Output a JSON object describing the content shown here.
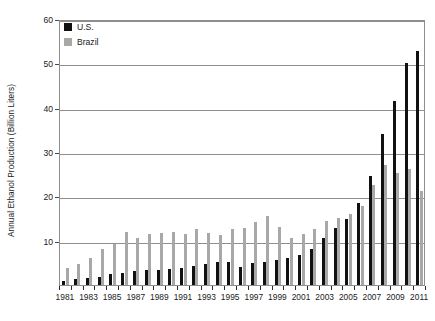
{
  "chart_data": {
    "type": "bar",
    "title": "",
    "xlabel": "",
    "ylabel": "Annual Ethanol Production (Billion Liters)",
    "ylim": [
      0,
      60
    ],
    "yticks": [
      0,
      10,
      20,
      30,
      40,
      50,
      60
    ],
    "ytick_labels": [
      "",
      "10",
      "20",
      "30",
      "40",
      "50",
      "60"
    ],
    "grid": true,
    "legend_position": "top-left",
    "categories": [
      "1981",
      "1982",
      "1983",
      "1984",
      "1985",
      "1986",
      "1987",
      "1988",
      "1989",
      "1990",
      "1991",
      "1992",
      "1993",
      "1994",
      "1995",
      "1996",
      "1997",
      "1998",
      "1999",
      "2000",
      "2001",
      "2002",
      "2003",
      "2004",
      "2005",
      "2006",
      "2007",
      "2008",
      "2009",
      "2010",
      "2011"
    ],
    "xtick_labels": [
      "1981",
      "1983",
      "1985",
      "1987",
      "1989",
      "1991",
      "1993",
      "1995",
      "1997",
      "1999",
      "2001",
      "2003",
      "2005",
      "2007",
      "2009",
      "2011"
    ],
    "series": [
      {
        "name": "U.S.",
        "color": "#111111",
        "values": [
          1.0,
          1.4,
          1.6,
          1.9,
          2.4,
          2.8,
          3.2,
          3.4,
          3.4,
          3.5,
          3.8,
          4.3,
          4.8,
          5.3,
          5.1,
          4.1,
          4.9,
          5.3,
          5.6,
          6.2,
          6.7,
          8.1,
          10.6,
          12.9,
          14.8,
          18.4,
          24.6,
          34.1,
          41.4,
          50.1,
          52.8
        ]
      },
      {
        "name": "Brazil",
        "color": "#a8a8a8",
        "values": [
          3.9,
          4.8,
          6.2,
          8.2,
          9.2,
          11.9,
          10.5,
          11.4,
          11.8,
          11.9,
          11.4,
          12.7,
          11.8,
          11.3,
          12.7,
          12.8,
          14.3,
          15.5,
          13.0,
          10.6,
          11.5,
          12.6,
          14.4,
          15.1,
          16.0,
          17.8,
          22.5,
          27.0,
          25.2,
          26.2,
          21.1
        ]
      }
    ]
  }
}
